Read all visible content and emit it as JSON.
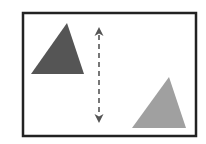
{
  "diagram": {
    "canvas": {
      "width": 206,
      "height": 144,
      "background": "#ffffff"
    },
    "frame": {
      "x": 23,
      "y": 13,
      "width": 173,
      "height": 123,
      "stroke": "#222222",
      "stroke_width": 2.5
    },
    "shapes": [
      {
        "id": "dark-triangle",
        "type": "triangle",
        "points": "67,23 31,74 84,74",
        "fill": "#555555"
      },
      {
        "id": "light-triangle",
        "type": "triangle",
        "points": "169,77 132,128 186,128",
        "fill": "#a0a0a0"
      }
    ],
    "arrow": {
      "type": "double-headed-dashed",
      "orientation": "vertical",
      "x": 99,
      "y1": 27,
      "y2": 123,
      "stroke": "#555555",
      "dash": "5,4"
    }
  }
}
